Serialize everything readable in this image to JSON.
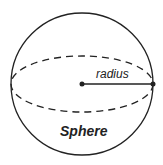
{
  "diagram": {
    "title": "Sphere",
    "radius_label": "radius",
    "stroke_color": "#222222",
    "background": "#ffffff"
  }
}
